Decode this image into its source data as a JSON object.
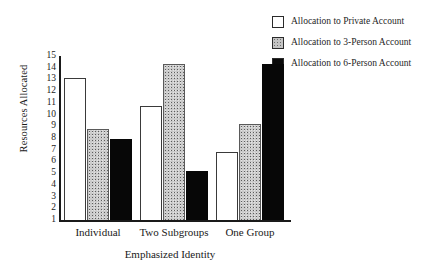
{
  "chart_data": {
    "type": "bar",
    "title": "",
    "xlabel": "Emphasized Identity",
    "ylabel": "Resources Allocated",
    "categories": [
      "Individual",
      "Two Subgroups",
      "One Group"
    ],
    "series": [
      {
        "name": "Allocation to Private Account",
        "values": [
          13.1,
          10.7,
          6.8
        ],
        "color": "#ffffff"
      },
      {
        "name": "Allocation to 3-Person Account",
        "values": [
          8.8,
          14.3,
          9.2
        ],
        "color": "#c9c9c9"
      },
      {
        "name": "Allocation to 6-Person Account",
        "values": [
          7.9,
          5.2,
          14.3
        ],
        "color": "#070707"
      }
    ],
    "ylim": [
      1,
      15
    ],
    "yticks": [
      15,
      14,
      13,
      12,
      11,
      10,
      9,
      8,
      7,
      6,
      5,
      4,
      3,
      2,
      1
    ],
    "ytick_labels": [
      "15",
      "14",
      "13",
      "12",
      "11",
      "10",
      "9",
      "8",
      "7",
      "6",
      "5",
      "4",
      "3",
      "2",
      "1"
    ],
    "grid": false,
    "legend_position": "top-right"
  },
  "legend": {
    "items": [
      {
        "label": "Allocation to Private Account",
        "swatch": "white-swatch-icon"
      },
      {
        "label": "Allocation to 3-Person Account",
        "swatch": "gray-stipple-swatch-icon"
      },
      {
        "label": "Allocation to 6-Person Account",
        "swatch": "black-swatch-icon"
      }
    ]
  }
}
